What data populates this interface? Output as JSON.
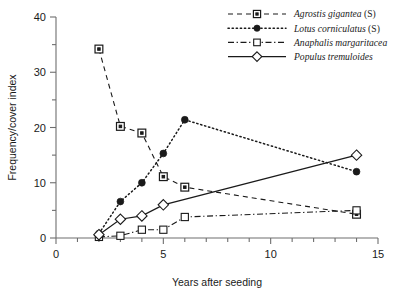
{
  "chart_data": {
    "type": "line",
    "title": "",
    "xlabel": "Years after seeding",
    "ylabel": "Frequency/cover index",
    "xlim": [
      0,
      15
    ],
    "ylim": [
      0,
      40
    ],
    "xticks": [
      0,
      5,
      10,
      15
    ],
    "xticklabels": [
      "0",
      "5",
      "10",
      "15"
    ],
    "xminor_step": 1,
    "yticks": [
      0,
      10,
      20,
      30,
      40
    ],
    "yticklabels": [
      "0",
      "10",
      "20",
      "30",
      "40"
    ],
    "yminor_step": 5,
    "grid": false,
    "legend_position": "top-right",
    "series": [
      {
        "name": "Agrostis gigantea (S)",
        "label_italic": "Agrostis gigantea",
        "label_plain": " (S)",
        "linestyle": "dashed",
        "marker": "square-dot",
        "x": [
          2,
          3,
          4,
          5,
          6,
          14
        ],
        "y": [
          34.2,
          20.2,
          19.0,
          11.1,
          9.2,
          4.3
        ]
      },
      {
        "name": "Lotus corniculatus (S)",
        "label_italic": "Lotus corniculatus",
        "label_plain": " (S)",
        "linestyle": "dotted",
        "marker": "filled-circle",
        "x": [
          2,
          3,
          4,
          5,
          6,
          14
        ],
        "y": [
          0.8,
          6.6,
          10.0,
          15.3,
          21.4,
          12.0
        ]
      },
      {
        "name": "Anaphalis margaritacea",
        "label_italic": "Anaphalis margaritacea",
        "label_plain": "",
        "linestyle": "dash-dot",
        "marker": "open-square",
        "x": [
          2,
          3,
          4,
          5,
          6,
          14
        ],
        "y": [
          0.2,
          0.4,
          1.5,
          1.5,
          3.8,
          5.0
        ]
      },
      {
        "name": "Populus tremuloides",
        "label_italic": "Populus tremuloides",
        "label_plain": "",
        "linestyle": "solid",
        "marker": "open-diamond",
        "x": [
          2,
          3,
          4,
          5,
          14
        ],
        "y": [
          0.6,
          3.4,
          4.0,
          6.0,
          15.0
        ]
      }
    ]
  },
  "colors": {
    "ink": "#1a1a1a",
    "axis": "#6e6e6e",
    "background": "#ffffff"
  }
}
